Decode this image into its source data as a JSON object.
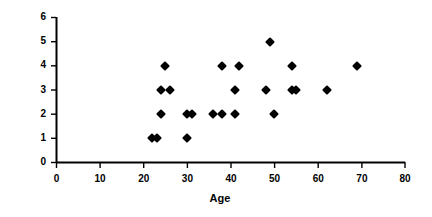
{
  "chart_data": {
    "type": "scatter",
    "title": "",
    "xlabel": "Age",
    "ylabel": "Family Size",
    "xlim": [
      0,
      80
    ],
    "ylim": [
      0,
      6
    ],
    "xticks": [
      0,
      10,
      20,
      30,
      40,
      50,
      60,
      70,
      80
    ],
    "yticks": [
      0,
      1,
      2,
      3,
      4,
      5,
      6
    ],
    "xtick_labels": [
      "0",
      "10",
      "20",
      "30",
      "40",
      "50",
      "60",
      "70",
      "80"
    ],
    "ytick_labels": [
      "0",
      "1",
      "2",
      "3",
      "4",
      "5",
      "6"
    ],
    "grid": false,
    "legend": false,
    "marker": "diamond",
    "marker_color": "#000000",
    "x": [
      22,
      23,
      30,
      24,
      30,
      31,
      36,
      38,
      41,
      50,
      24,
      26,
      41,
      48,
      54,
      55,
      62,
      25,
      38,
      42,
      54,
      69,
      49
    ],
    "y": [
      1,
      1,
      1,
      2,
      2,
      2,
      2,
      2,
      2,
      2,
      3,
      3,
      3,
      3,
      3,
      3,
      3,
      4,
      4,
      4,
      4,
      4,
      5
    ],
    "points": [
      {
        "x": 22,
        "y": 1
      },
      {
        "x": 23,
        "y": 1
      },
      {
        "x": 30,
        "y": 1
      },
      {
        "x": 24,
        "y": 2
      },
      {
        "x": 30,
        "y": 2
      },
      {
        "x": 31,
        "y": 2
      },
      {
        "x": 36,
        "y": 2
      },
      {
        "x": 38,
        "y": 2
      },
      {
        "x": 41,
        "y": 2
      },
      {
        "x": 50,
        "y": 2
      },
      {
        "x": 24,
        "y": 3
      },
      {
        "x": 26,
        "y": 3
      },
      {
        "x": 41,
        "y": 3
      },
      {
        "x": 48,
        "y": 3
      },
      {
        "x": 54,
        "y": 3
      },
      {
        "x": 55,
        "y": 3
      },
      {
        "x": 62,
        "y": 3
      },
      {
        "x": 25,
        "y": 4
      },
      {
        "x": 38,
        "y": 4
      },
      {
        "x": 42,
        "y": 4
      },
      {
        "x": 54,
        "y": 4
      },
      {
        "x": 69,
        "y": 4
      },
      {
        "x": 49,
        "y": 5
      }
    ]
  },
  "axes": {
    "x_axis_label": "Age",
    "y_axis_label": "Family Size"
  },
  "colors": {
    "background": "#ffffff",
    "axis": "#000000",
    "marker": "#000000"
  }
}
